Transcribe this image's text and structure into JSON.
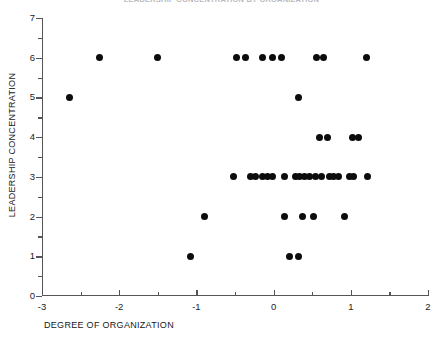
{
  "chart_data": {
    "type": "scatter",
    "title": "LEADERSHIP CONCENTRATION BY ORGANIZATION",
    "xlabel": "DEGREE OF ORGANIZATION",
    "ylabel": "LEADERSHIP CONCENTRATION",
    "xlim": [
      -3,
      2
    ],
    "ylim": [
      0,
      7
    ],
    "xticks": [
      -3,
      -2,
      -1,
      0,
      1,
      2
    ],
    "xtick_labels": [
      "-3",
      "-2",
      "-1",
      "0",
      "1",
      "2"
    ],
    "x_minor_ticks": [
      -2.5,
      -1.5,
      -0.5,
      0.5,
      1.5
    ],
    "yticks": [
      0,
      1,
      2,
      3,
      4,
      5,
      6,
      7
    ],
    "ytick_labels": [
      "0",
      "1",
      "2",
      "3",
      "4",
      "5",
      "6",
      "7"
    ],
    "y_minor_ticks": [
      0.5,
      1.5,
      2.5,
      3.5,
      4.5,
      5.5,
      6.5
    ],
    "grid": false,
    "legend": false,
    "marker": "filled-circle",
    "marker_color": "#0c0c0c",
    "points": [
      {
        "x": -2.65,
        "y": 5
      },
      {
        "x": 0.32,
        "y": 5
      },
      {
        "x": -2.25,
        "y": 6
      },
      {
        "x": -1.5,
        "y": 6
      },
      {
        "x": -0.48,
        "y": 6
      },
      {
        "x": -0.36,
        "y": 6
      },
      {
        "x": -0.14,
        "y": 6
      },
      {
        "x": -0.02,
        "y": 6
      },
      {
        "x": 0.1,
        "y": 6
      },
      {
        "x": 0.56,
        "y": 6
      },
      {
        "x": 0.64,
        "y": 6
      },
      {
        "x": 1.2,
        "y": 6
      },
      {
        "x": 0.6,
        "y": 4
      },
      {
        "x": 0.7,
        "y": 4
      },
      {
        "x": 1.02,
        "y": 4
      },
      {
        "x": 1.1,
        "y": 4
      },
      {
        "x": -0.52,
        "y": 3
      },
      {
        "x": -0.3,
        "y": 3
      },
      {
        "x": -0.24,
        "y": 3
      },
      {
        "x": -0.14,
        "y": 3
      },
      {
        "x": -0.08,
        "y": 3
      },
      {
        "x": -0.02,
        "y": 3
      },
      {
        "x": 0.14,
        "y": 3
      },
      {
        "x": 0.28,
        "y": 3
      },
      {
        "x": 0.34,
        "y": 3
      },
      {
        "x": 0.4,
        "y": 3
      },
      {
        "x": 0.46,
        "y": 3
      },
      {
        "x": 0.54,
        "y": 3
      },
      {
        "x": 0.62,
        "y": 3
      },
      {
        "x": 0.72,
        "y": 3
      },
      {
        "x": 0.78,
        "y": 3
      },
      {
        "x": 0.84,
        "y": 3
      },
      {
        "x": 0.98,
        "y": 3
      },
      {
        "x": 1.04,
        "y": 3
      },
      {
        "x": 1.22,
        "y": 3
      },
      {
        "x": -0.9,
        "y": 2
      },
      {
        "x": 0.14,
        "y": 2
      },
      {
        "x": 0.38,
        "y": 2
      },
      {
        "x": 0.52,
        "y": 2
      },
      {
        "x": 0.92,
        "y": 2
      },
      {
        "x": -1.08,
        "y": 1
      },
      {
        "x": 0.2,
        "y": 1
      },
      {
        "x": 0.32,
        "y": 1
      }
    ]
  }
}
